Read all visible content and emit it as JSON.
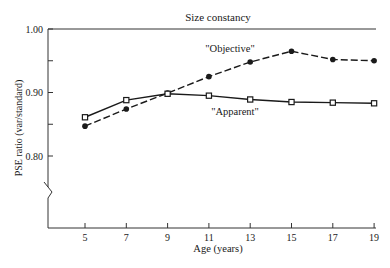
{
  "chart_data": {
    "type": "line",
    "title": "Size constancy",
    "xlabel": "Age (years)",
    "ylabel": "PSE ratio (var/standard)",
    "x": [
      5,
      7,
      9,
      11,
      13,
      15,
      17,
      19
    ],
    "xticks": [
      "5",
      "7",
      "9",
      "11",
      "13",
      "15",
      "17",
      "19"
    ],
    "yticks": [
      "0.80",
      "0.90",
      "1.00"
    ],
    "ylim": [
      0.8,
      1.0
    ],
    "axis_break": true,
    "grid": false,
    "series": [
      {
        "name": "\"Objective\"",
        "marker": "filled-circle",
        "line": "dashed",
        "values": [
          0.847,
          0.874,
          0.899,
          0.925,
          0.948,
          0.965,
          0.952,
          0.95
        ]
      },
      {
        "name": "\"Apparent\"",
        "marker": "open-square",
        "line": "solid",
        "values": [
          0.861,
          0.888,
          0.898,
          0.895,
          0.889,
          0.885,
          0.884,
          0.883
        ]
      }
    ],
    "annotations": [
      {
        "text": "\"Objective\"",
        "near_x": 11
      },
      {
        "text": "\"Apparent\"",
        "near_x": 12
      }
    ]
  }
}
